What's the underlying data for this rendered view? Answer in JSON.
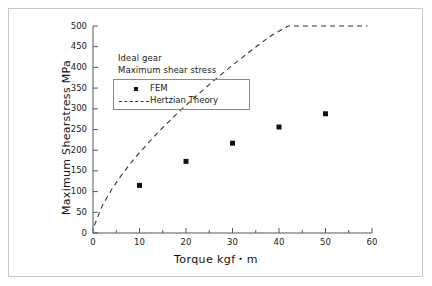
{
  "chart_data": {
    "type": "scatter",
    "title": "",
    "xlabel": "Torque kgf・m",
    "ylabel": "Maximum Shearstress MPa",
    "xlim": [
      0,
      60
    ],
    "ylim": [
      0,
      500
    ],
    "xticks": [
      0,
      10,
      20,
      30,
      40,
      50,
      60
    ],
    "xminor_step": 5,
    "yticks": [
      0,
      50,
      100,
      150,
      200,
      250,
      300,
      350,
      400,
      450,
      500
    ],
    "grid": false,
    "legend_position": "upper-left",
    "annotations": [
      "Ideal gear",
      "Maximum shear stress"
    ],
    "series": [
      {
        "name": "FEM",
        "type": "scatter",
        "marker": "square",
        "color": "#111111",
        "x": [
          10,
          20,
          30,
          40,
          50
        ],
        "values": [
          115,
          173,
          217,
          256,
          288
        ]
      },
      {
        "name": "Hertzian Theory",
        "type": "line",
        "linestyle": "dashed",
        "color": "#333333",
        "x": [
          0.3,
          2,
          4,
          6,
          8,
          10,
          14,
          18,
          22,
          26,
          30,
          34,
          38,
          42,
          46,
          50,
          54,
          59
        ],
        "values": [
          19,
          66,
          105,
          138,
          166,
          192,
          239,
          282,
          320,
          356,
          390,
          422,
          453,
          482,
          511,
          538,
          565,
          598
        ]
      }
    ]
  },
  "axis": {
    "x_tick_labels": [
      "0",
      "10",
      "20",
      "30",
      "40",
      "50",
      "60"
    ],
    "y_tick_labels": [
      "0",
      "50",
      "100",
      "150",
      "200",
      "250",
      "300",
      "350",
      "400",
      "450",
      "500"
    ],
    "x_title": "Torque kgf・m",
    "y_title": "Maximum Shearstress MPa"
  },
  "legend": {
    "items": [
      {
        "label": "FEM",
        "glyph": "square-marker"
      },
      {
        "label": "Hertzian Theory",
        "glyph": "dashed-line"
      }
    ]
  },
  "annotations": {
    "line1": "Ideal gear",
    "line2": "Maximum shear stress"
  },
  "colors": {
    "marker": "#111111",
    "curve": "#333333",
    "axis": "#555555",
    "frame": "#c9c9c9",
    "text": "#1a1a1a"
  }
}
